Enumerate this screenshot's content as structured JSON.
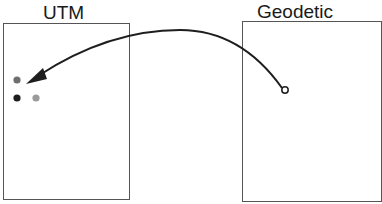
{
  "diagram": {
    "left_panel": {
      "label": "UTM"
    },
    "right_panel": {
      "label": "Geodetic"
    },
    "points": [
      {
        "name": "gray-point",
        "color": "#6e6e6e"
      },
      {
        "name": "black-point",
        "color": "#1e1e1e"
      },
      {
        "name": "light-gray-point",
        "color": "#9a9a9a"
      }
    ],
    "source_point": {
      "name": "open-circle",
      "fill": "#ffffff",
      "stroke": "#1e1e1e"
    },
    "arrow": {
      "color": "#1e1e1e",
      "from": "Geodetic",
      "to": "UTM"
    }
  }
}
